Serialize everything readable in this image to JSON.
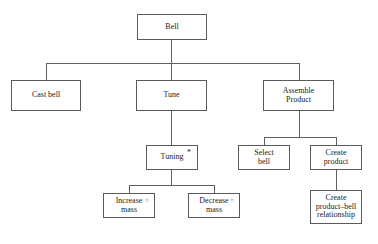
{
  "diagram": {
    "type": "activity-decomposition-tree",
    "root_label": "Bell",
    "nodes": [
      {
        "id": "bell",
        "label": "Bell",
        "marker": "",
        "x": 137,
        "y": 14,
        "w": 70,
        "h": 26,
        "font_size": 8
      },
      {
        "id": "cast-bell",
        "label": "Cast bell",
        "marker": "",
        "x": 11,
        "y": 80,
        "w": 70,
        "h": 31,
        "font_size": 8
      },
      {
        "id": "tune",
        "label": "Tune",
        "marker": "",
        "x": 136,
        "y": 80,
        "w": 71,
        "h": 31,
        "font_size": 8
      },
      {
        "id": "assemble",
        "label": "Assemble\nProduct",
        "marker": "",
        "x": 263,
        "y": 80,
        "w": 71,
        "h": 31,
        "font_size": 8
      },
      {
        "id": "tuning",
        "label": "Tuning",
        "marker": "*",
        "x": 146,
        "y": 145,
        "w": 52,
        "h": 25,
        "font_size": 8
      },
      {
        "id": "select-bell",
        "label": "Select\nbell",
        "marker": "",
        "x": 238,
        "y": 145,
        "w": 52,
        "h": 25,
        "font_size": 8
      },
      {
        "id": "create-prod",
        "label": "Create\nproduct",
        "marker": "",
        "x": 310,
        "y": 145,
        "w": 52,
        "h": 25,
        "font_size": 8
      },
      {
        "id": "increase",
        "label": "Increase\nmass",
        "marker": "o",
        "x": 103,
        "y": 193,
        "w": 52,
        "h": 25,
        "font_size": 8
      },
      {
        "id": "decrease",
        "label": "Decrease\nmass",
        "marker": "o",
        "x": 188,
        "y": 193,
        "w": 52,
        "h": 25,
        "font_size": 8
      },
      {
        "id": "create-rel",
        "label": "Create\nproduct–bell\nrelationship",
        "marker": "",
        "x": 310,
        "y": 190,
        "w": 52,
        "h": 34,
        "font_size": 8
      }
    ],
    "markers": {
      "star": "*",
      "circle": "○",
      "star_meaning": "repetition",
      "circle_meaning": "selection"
    },
    "edges": [
      {
        "from": "bell",
        "to": "cast-bell",
        "kind": "bus"
      },
      {
        "from": "bell",
        "to": "tune",
        "kind": "bus"
      },
      {
        "from": "bell",
        "to": "assemble",
        "kind": "bus"
      },
      {
        "from": "tune",
        "to": "tuning",
        "kind": "straight"
      },
      {
        "from": "assemble",
        "to": "select-bell",
        "kind": "bus"
      },
      {
        "from": "assemble",
        "to": "create-prod",
        "kind": "bus"
      },
      {
        "from": "tuning",
        "to": "increase",
        "kind": "bus"
      },
      {
        "from": "tuning",
        "to": "decrease",
        "kind": "bus"
      },
      {
        "from": "create-prod",
        "to": "create-rel",
        "kind": "straight"
      }
    ],
    "colors": {
      "box_border": "#5a5a5a",
      "line": "#5f5f5f",
      "text": "#1a1a1a",
      "background": "#ffffff"
    }
  },
  "caption": {
    "text": "",
    "note": "clipped-illegible-figure-caption"
  }
}
